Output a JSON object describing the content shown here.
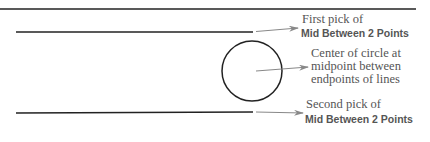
{
  "diagram": {
    "colors": {
      "line": "#222222",
      "arrow": "#888888",
      "text": "#555555"
    },
    "callouts": {
      "first_pick": {
        "line1": "First pick of",
        "line2": "Mid Between 2 Points"
      },
      "center": {
        "line1": "Center of circle at",
        "line2": "midpoint between",
        "line3": "endpoints of lines"
      },
      "second_pick": {
        "line1": "Second pick of",
        "line2": "Mid Between 2 Points"
      }
    }
  }
}
